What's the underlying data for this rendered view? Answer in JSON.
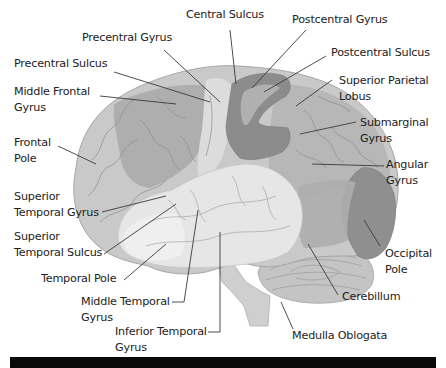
{
  "diagram": {
    "colors": {
      "background": "#ffffff",
      "frontal_lobe": "#c9c9c9",
      "frontal_dark": "#a8a8a8",
      "precentral_gyrus": "#dcdcdc",
      "postcentral_gyrus": "#8a8a8a",
      "parietal_lobe": "#b5b5b5",
      "temporal_lobe": "#e6e6e6",
      "occipital_lobe": "#8f8f8f",
      "cerebellum": "#c4c4c4",
      "brainstem": "#cfcfcf",
      "leader_line": "#3a3a3a",
      "label_text": "#222222",
      "footer_bar": "#0a0a0a"
    },
    "labels": [
      {
        "id": "central-sulcus",
        "text": "Central Sulcus"
      },
      {
        "id": "postcentral-gyrus",
        "text": "Postcentral Gyrus"
      },
      {
        "id": "precentral-gyrus",
        "text": "Precentral Gyrus"
      },
      {
        "id": "postcentral-sulcus",
        "text": "Postcentral Sulcus"
      },
      {
        "id": "precentral-sulcus",
        "text": "Precentral Sulcus"
      },
      {
        "id": "superior-parietal-lobus",
        "text": "Superior Parietal\nLobus"
      },
      {
        "id": "middle-frontal-gyrus",
        "text": "Middle Frontal\nGyrus"
      },
      {
        "id": "submarginal-gyrus",
        "text": "Submarginal\nGyrus"
      },
      {
        "id": "frontal-pole",
        "text": "Frontal\nPole"
      },
      {
        "id": "angular-gyrus",
        "text": "Angular\nGyrus"
      },
      {
        "id": "superior-temporal-gyrus",
        "text": "Superior\nTemporal Gyrus"
      },
      {
        "id": "superior-temporal-sulcus",
        "text": "Superior\nTemporal Sulcus"
      },
      {
        "id": "occipital-pole",
        "text": "Occipital\nPole"
      },
      {
        "id": "temporal-pole",
        "text": "Temporal Pole"
      },
      {
        "id": "cerebillum",
        "text": "Cerebillum"
      },
      {
        "id": "middle-temporal-gyrus",
        "text": "Middle Temporal\nGyrus"
      },
      {
        "id": "inferior-temporal-gyrus",
        "text": "Inferior Temporal\nGyrus"
      },
      {
        "id": "medulla-oblogata",
        "text": "Medulla Oblogata"
      }
    ]
  }
}
